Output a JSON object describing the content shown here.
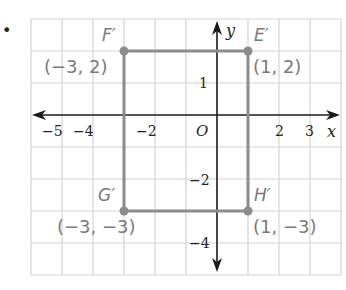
{
  "bullet": "•",
  "axes": {
    "x_label": "x",
    "y_label": "y",
    "origin_label": "O",
    "x_ticks": [
      {
        "label": "−5",
        "x": -5
      },
      {
        "label": "−4",
        "x": -4
      },
      {
        "label": "−2",
        "x": -2
      },
      {
        "label": "2",
        "x": 2
      },
      {
        "label": "3",
        "x": 3
      }
    ],
    "y_ticks": [
      {
        "label": "1",
        "y": 1
      },
      {
        "label": "−2",
        "y": -2
      },
      {
        "label": "−4",
        "y": -4
      }
    ],
    "x_range": [
      -6,
      4
    ],
    "y_range": [
      -5,
      3
    ]
  },
  "rectangle": {
    "color": "#8c8c8c",
    "vertices": [
      {
        "name": "F′",
        "coord_label": "(−3, 2)",
        "x": -3,
        "y": 2
      },
      {
        "name": "E′",
        "coord_label": "(1, 2)",
        "x": 1,
        "y": 2
      },
      {
        "name": "H′",
        "coord_label": "(1, −3)",
        "x": 1,
        "y": -3
      },
      {
        "name": "G′",
        "coord_label": "(−3, −3)",
        "x": -3,
        "y": -3
      }
    ]
  },
  "colors": {
    "grid": "#d4d4d4",
    "axis": "#1a1a1a",
    "shape": "#8c8c8c",
    "label": "#7a7a7a"
  }
}
